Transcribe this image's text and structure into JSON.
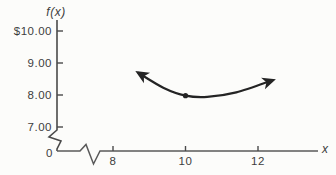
{
  "figure": {
    "background": "#fcfcfa",
    "axis_color": "#4a4a4a",
    "curve_color": "#242424",
    "text_color": "#3d3d3d"
  },
  "chart_data": {
    "type": "line",
    "title": "",
    "ylabel": "f(x)",
    "xlabel": "x",
    "origin_label": "0",
    "grid": false,
    "legend": false,
    "xlim": [
      8,
      12.6
    ],
    "ylim": [
      7,
      10.5
    ],
    "axis_breaks": {
      "x_axis": true,
      "y_axis": true
    },
    "y_ticks": [
      {
        "label": "$10.00",
        "value": 10
      },
      {
        "label": "9.00",
        "value": 9
      },
      {
        "label": "8.00",
        "value": 8
      },
      {
        "label": "7.00",
        "value": 7
      }
    ],
    "x_ticks": [
      {
        "label": "8",
        "value": 8
      },
      {
        "label": "10",
        "value": 10
      },
      {
        "label": "12",
        "value": 12
      }
    ],
    "series": [
      {
        "name": "f(x) curve",
        "arrow_start": true,
        "arrow_end": true,
        "points": [
          [
            8.7,
            8.69
          ],
          [
            9.4,
            8.22
          ],
          [
            10.0,
            7.98
          ],
          [
            10.6,
            7.94
          ],
          [
            11.4,
            8.08
          ],
          [
            12.4,
            8.46
          ]
        ]
      }
    ],
    "marked_point": {
      "x": 10,
      "y": 7.98,
      "note": "minimum of curve near (10, $8.00)"
    }
  }
}
